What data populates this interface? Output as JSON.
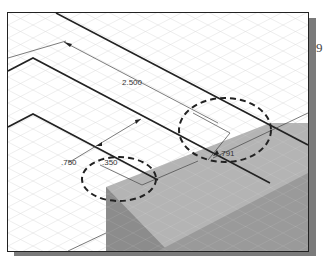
{
  "view": {
    "type": "isometric-cad-viewport",
    "grid": "isometric",
    "colors": {
      "background": "#ffffff",
      "grid_line": "#d8d8d8",
      "edge": "#222222",
      "solid_top": "#b4b4b4",
      "solid_side": "#8c8c8c",
      "solid_dark": "#7a7a7a",
      "callout": "#222222",
      "shadow": "#7a7a7a"
    }
  },
  "dimensions": [
    {
      "id": "dim-2500",
      "label": "2.500"
    },
    {
      "id": "dim-750",
      "label": ".750"
    },
    {
      "id": "dim-350",
      "label": ".350",
      "highlighted": true
    },
    {
      "id": "dim-791",
      "label": ".791",
      "highlighted": true
    }
  ],
  "edge_text": "9"
}
